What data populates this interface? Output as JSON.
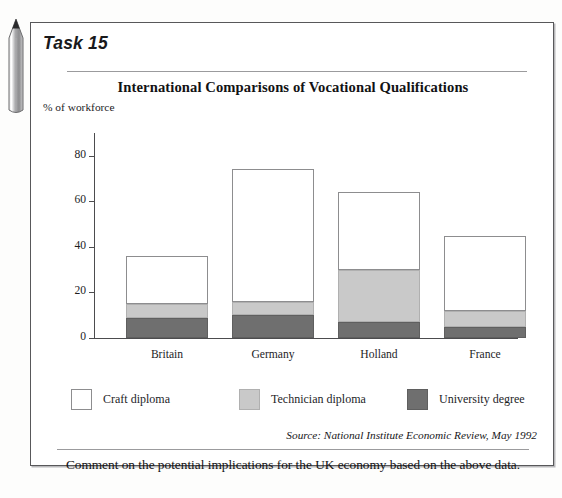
{
  "icons": {
    "pencil": "pencil-icon"
  },
  "task": {
    "label": "Task 15",
    "prompt": "Comment on the potential implications for the UK economy based on the above data.",
    "source": "Source: National Institute Economic Review, May 1992"
  },
  "chart_data": {
    "type": "bar",
    "stacked": true,
    "title": "International Comparisons of Vocational Qualifications",
    "xlabel": "",
    "ylabel": "% of workforce",
    "ylim": [
      0,
      90
    ],
    "yticks": [
      0,
      20,
      40,
      60,
      80
    ],
    "ytick_labels": [
      "0",
      "20",
      "40",
      "60",
      "80"
    ],
    "grid": false,
    "legend_position": "bottom",
    "categories": [
      "Britain",
      "Germany",
      "Holland",
      "France"
    ],
    "series": [
      {
        "name": "University degree",
        "color": "#6f6f6f",
        "values": [
          9,
          10,
          7,
          5
        ]
      },
      {
        "name": "Technician diploma",
        "color": "#c9c9c9",
        "values": [
          6,
          6,
          23,
          7
        ]
      },
      {
        "name": "Craft diploma",
        "color": "#ffffff",
        "values": [
          21,
          58,
          34,
          33
        ]
      }
    ],
    "totals": [
      36,
      74,
      64,
      45
    ]
  },
  "colors": {
    "craft": "#ffffff",
    "technician": "#c9c9c9",
    "university": "#6f6f6f",
    "axis": "#4c4c4e",
    "border": "#58585a"
  }
}
